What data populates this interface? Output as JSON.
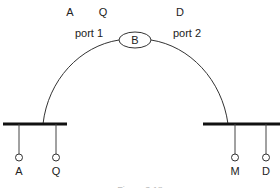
{
  "diagram": {
    "type": "network bridge diagram",
    "top_labels": {
      "port1_addresses": [
        "A",
        "Q"
      ],
      "port2_addresses": [
        "D"
      ]
    },
    "bridge": {
      "label": "B"
    },
    "ports": [
      {
        "label": "port 1"
      },
      {
        "label": "port 2"
      }
    ],
    "left_lan": {
      "stations": [
        {
          "label": "A"
        },
        {
          "label": "Q"
        }
      ]
    },
    "right_lan": {
      "stations": [
        {
          "label": "M"
        },
        {
          "label": "D"
        }
      ]
    },
    "caption": "Figure 3.18"
  },
  "colors": {
    "line": "#333333",
    "bus": "#111111",
    "text": "#222222"
  }
}
